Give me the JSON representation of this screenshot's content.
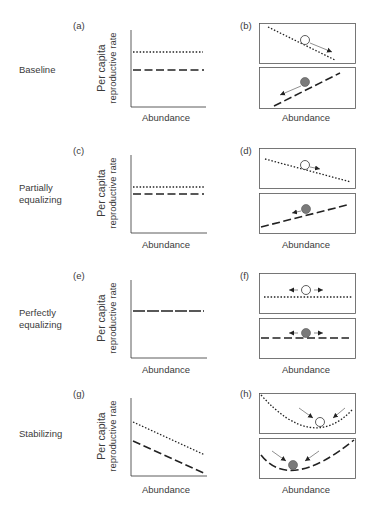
{
  "figure": {
    "rows": [
      {
        "row_label": "Baseline",
        "left_panel": {
          "label": "(a)",
          "xlabel": "Abundance",
          "ylabel_line1": "Per capita",
          "ylabel_line2": "reproductive rate"
        },
        "right_panel": {
          "label": "(b)",
          "xlabel": "Abundance"
        }
      },
      {
        "row_label_line1": "Partially",
        "row_label_line2": "equalizing",
        "left_panel": {
          "label": "(c)",
          "xlabel": "Abundance",
          "ylabel_line1": "Per capita",
          "ylabel_line2": "reproductive rate"
        },
        "right_panel": {
          "label": "(d)",
          "xlabel": "Abundance"
        }
      },
      {
        "row_label_line1": "Perfectly",
        "row_label_line2": "equalizing",
        "left_panel": {
          "label": "(e)",
          "xlabel": "Abundance",
          "ylabel_line1": "Per capita",
          "ylabel_line2": "reproductive rate"
        },
        "right_panel": {
          "label": "(f)",
          "xlabel": "Abundance"
        }
      },
      {
        "row_label": "Stabilizing",
        "left_panel": {
          "label": "(g)",
          "xlabel": "Abundance",
          "ylabel_line1": "Per capita",
          "ylabel_line2": "reproductive rate"
        },
        "right_panel": {
          "label": "(h)",
          "xlabel": "Abundance"
        }
      }
    ],
    "legend_semantics": {
      "dotted_line": "species 1 (open circle)",
      "dashed_line": "species 2 (grey circle)"
    },
    "colors": {
      "line": "#222222",
      "text": "#3a3a3a",
      "box": "#555555",
      "open_circle_fill": "#ffffff",
      "grey_circle_fill": "#7a7a7a",
      "arrow": "#444444"
    }
  }
}
